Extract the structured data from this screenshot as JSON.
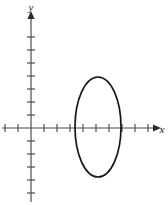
{
  "figure": {
    "width": 168,
    "height": 205,
    "background_color": "#ffffff"
  },
  "axes": {
    "x_axis": {
      "label": "x",
      "label_x": 162,
      "label_y": 133,
      "line_color": "#4d4d4d",
      "line_width": 1.2,
      "y_pixel": 128,
      "x_start": 2,
      "x_end": 156,
      "arrow": "right-arrow",
      "arrow_tip_x": 161,
      "tick_spacing": 13,
      "tick_half_length": 4,
      "ticks_left_of_origin": 2,
      "ticks_right_of_origin": 9
    },
    "y_axis": {
      "label": "y",
      "label_x": 31,
      "label_y": 11,
      "line_color": "#4d4d4d",
      "line_width": 1.2,
      "x_pixel": 31,
      "y_start": 16,
      "y_end": 202,
      "arrow": "up-arrow",
      "arrow_tip_y": 11,
      "tick_spacing": 13,
      "tick_half_length": 4,
      "ticks_above_origin": 7,
      "ticks_below_origin": 5
    },
    "origin": {
      "x": 31,
      "y": 128
    }
  },
  "chart_data": {
    "type": "line",
    "xlabel": "x",
    "ylabel": "y",
    "grid": false,
    "legend": "none",
    "tick_unit_pixels": 13,
    "xlim": [
      -2.2,
      10.0
    ],
    "ylim": [
      -5.7,
      9.0
    ],
    "series": [
      {
        "name": "ellipse",
        "shape": "ellipse",
        "center": {
          "x_units": 5.15,
          "y_units": 0.08
        },
        "semi_axis_x_units": 1.77,
        "semi_axis_y_units": 3.85,
        "center_pixels": {
          "cx": 98,
          "cy": 127
        },
        "radii_pixels": {
          "rx": 23,
          "ry": 50
        },
        "stroke_color": "#171717",
        "stroke_width": 1.7,
        "fill": "none",
        "orientation": "major-axis-vertical"
      }
    ]
  }
}
